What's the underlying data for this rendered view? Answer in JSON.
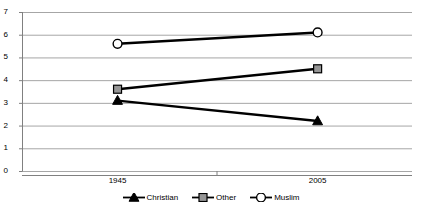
{
  "chart_data": {
    "type": "line",
    "title": "",
    "subtitle": "",
    "xlabel": "",
    "ylabel": "",
    "categories": [
      "1945",
      "2005"
    ],
    "x_tick_labels": [
      "1945",
      "2005"
    ],
    "y_tick_labels": [
      "0",
      "1",
      "2",
      "3",
      "4",
      "5",
      "6",
      "7"
    ],
    "ylim": [
      0,
      7
    ],
    "y_tick_step": 1,
    "grid": {
      "horizontal": true,
      "vertical": false,
      "color": "#a6a6a6"
    },
    "legend": {
      "position": "bottom",
      "orientation": "horizontal"
    },
    "series": [
      {
        "name": "Christian",
        "values": [
          3.1,
          2.2
        ],
        "marker": "triangle",
        "marker_fill": "#000000",
        "marker_stroke": "#000000",
        "line_color": "#000000",
        "line_width": 2.4
      },
      {
        "name": "Other",
        "values": [
          3.6,
          4.5
        ],
        "marker": "square",
        "marker_fill": "#969696",
        "marker_stroke": "#000000",
        "line_color": "#000000",
        "line_width": 2.4
      },
      {
        "name": "Muslim",
        "values": [
          5.6,
          6.1
        ],
        "marker": "circle",
        "marker_fill": "#ffffff",
        "marker_stroke": "#000000",
        "line_color": "#000000",
        "line_width": 2.4
      }
    ],
    "axis_color": "#808080",
    "plot_background": "#ffffff"
  }
}
